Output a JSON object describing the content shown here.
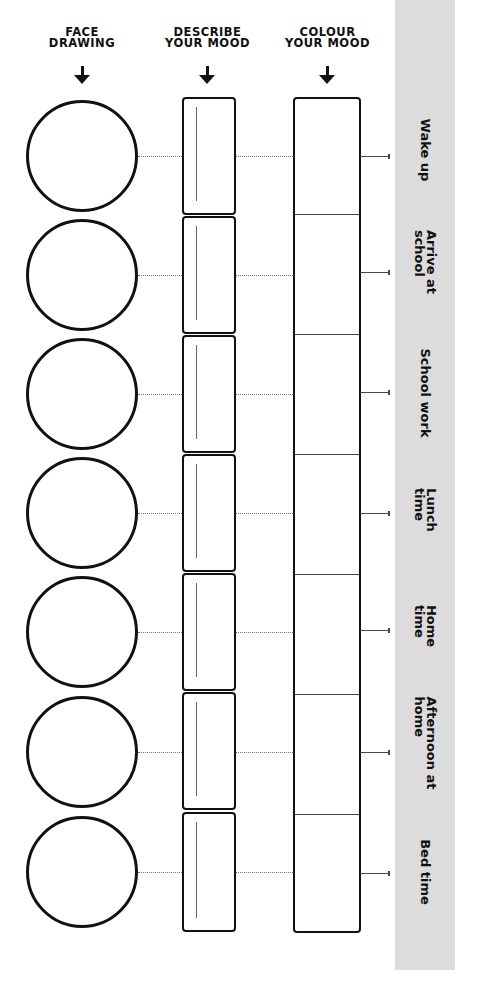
{
  "headers": {
    "face": "FACE\nDRAWING",
    "describe": "DESCRIBE\nYOUR MOOD",
    "colour": "COLOUR\nYOUR MOOD"
  },
  "icons": {
    "header_arrow": "arrow-down-icon"
  },
  "colors": {
    "strip": "#dcdcdc",
    "ink": "#111111"
  },
  "rows": [
    {
      "label": "Wake up"
    },
    {
      "label": "Arrive at\nschool"
    },
    {
      "label": "School work"
    },
    {
      "label": "Lunch\ntime"
    },
    {
      "label": "Home\ntime"
    },
    {
      "label": "Afternoon at\nhome"
    },
    {
      "label": "Bed time"
    }
  ]
}
